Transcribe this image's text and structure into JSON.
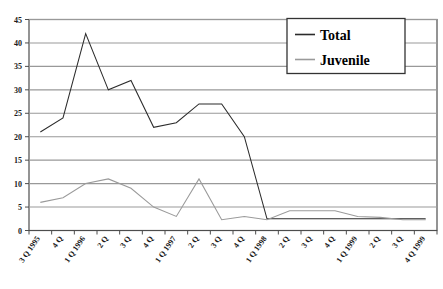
{
  "chart_data": {
    "type": "line",
    "title": "",
    "xlabel": "",
    "ylabel": "",
    "ylim": [
      0,
      45
    ],
    "ytick_step": 5,
    "grid": true,
    "legend_position": "top-right",
    "categories": [
      "3 Q 1995",
      "4 Q",
      "1 Q 1996",
      "2 Q",
      "3 Q",
      "4 Q",
      "1 Q 1997",
      "2 Q",
      "3 Q",
      "4 Q",
      "1 Q 1998",
      "2 Q",
      "3 Q",
      "4 Q",
      "1 Q 1999",
      "2 Q",
      "3 Q",
      "4 Q 1999"
    ],
    "ytick_labels": [
      "0",
      "5",
      "10",
      "15",
      "20",
      "25",
      "30",
      "35",
      "40",
      "45"
    ],
    "ytick_values": [
      0,
      5,
      10,
      15,
      20,
      25,
      30,
      35,
      40,
      45
    ],
    "series": [
      {
        "name": "Total",
        "color": "#2b2b2b",
        "values": [
          21,
          24,
          42,
          30,
          32,
          22,
          23,
          27,
          27,
          20,
          2.5,
          2.5,
          2.5,
          2.5,
          2.5,
          2.5,
          2.5,
          2.5
        ]
      },
      {
        "name": "Juvenile",
        "color": "#9a9a9a",
        "values": [
          6,
          7,
          10,
          11,
          9,
          5,
          3,
          11,
          2.3,
          3,
          2.3,
          4.2,
          4.2,
          4.2,
          3,
          2.8,
          2.3,
          2.3
        ]
      }
    ]
  },
  "legend": {
    "entries": [
      {
        "label": "Total",
        "swatch_name": "legend-swatch-total"
      },
      {
        "label": "Juvenile",
        "swatch_name": "legend-swatch-juvenile"
      }
    ]
  },
  "colors": {
    "total": "#2b2b2b",
    "juvenile": "#9a9a9a",
    "gridline": "#999999",
    "border": "#4d4d4d",
    "background": "#ffffff"
  }
}
